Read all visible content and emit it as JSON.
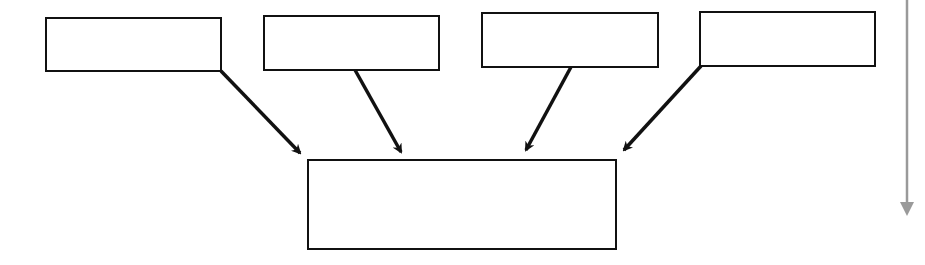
{
  "diagram": {
    "type": "many-to-one",
    "sources": [
      {
        "id": "source-1",
        "label": "",
        "x": 46,
        "y": 18,
        "w": 175,
        "h": 53
      },
      {
        "id": "source-2",
        "label": "",
        "x": 264,
        "y": 16,
        "w": 175,
        "h": 54
      },
      {
        "id": "source-3",
        "label": "",
        "x": 482,
        "y": 13,
        "w": 176,
        "h": 54
      },
      {
        "id": "source-4",
        "label": "",
        "x": 700,
        "y": 12,
        "w": 175,
        "h": 54
      }
    ],
    "target": {
      "id": "target",
      "label": "",
      "x": 308,
      "y": 160,
      "w": 308,
      "h": 89
    },
    "arrows": [
      {
        "from": "source-1",
        "x1": 221,
        "y1": 71,
        "x2": 305,
        "y2": 158
      },
      {
        "from": "source-2",
        "x1": 355,
        "y1": 70,
        "x2": 404,
        "y2": 158
      },
      {
        "from": "source-3",
        "x1": 571,
        "y1": 67,
        "x2": 523,
        "y2": 156
      },
      {
        "from": "source-4",
        "x1": 701,
        "y1": 66,
        "x2": 619,
        "y2": 155
      }
    ],
    "side_arrow": {
      "x": 907,
      "y1": 0,
      "y2": 222,
      "color": "#9a9a9a"
    },
    "colors": {
      "stroke": "#111111",
      "background": "#ffffff"
    }
  }
}
